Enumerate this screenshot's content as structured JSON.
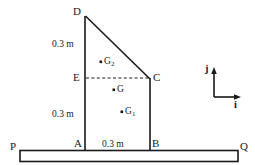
{
  "figure": {
    "stroke_color": "#1a1a1a",
    "background_color": "#ffffff",
    "vertices": [
      {
        "name": "D",
        "label": "D",
        "x": 85,
        "y": 16
      },
      {
        "name": "C",
        "label": "C",
        "x": 150,
        "y": 78
      },
      {
        "name": "E",
        "label": "E",
        "x": 85,
        "y": 78
      },
      {
        "name": "A",
        "label": "A",
        "x": 85,
        "y": 150
      },
      {
        "name": "B",
        "label": "B",
        "x": 150,
        "y": 150
      },
      {
        "name": "P",
        "label": "P",
        "x": 20,
        "y": 150
      },
      {
        "name": "Q",
        "label": "Q",
        "x": 238,
        "y": 150
      }
    ],
    "centroid_points": [
      {
        "name": "G2",
        "label": "G",
        "sub": "2",
        "x": 101,
        "y": 62
      },
      {
        "name": "G",
        "label": "G",
        "sub": "",
        "x": 114,
        "y": 90
      },
      {
        "name": "G1",
        "label": "G",
        "sub": "1",
        "x": 122,
        "y": 112
      }
    ],
    "dimensions": [
      {
        "name": "upper-height",
        "text": "0.3 m"
      },
      {
        "name": "lower-height",
        "text": "0.3 m"
      },
      {
        "name": "base-width",
        "text": "0.3 m"
      }
    ],
    "axes": {
      "vertical_label": "j",
      "horizontal_label": "i"
    }
  }
}
